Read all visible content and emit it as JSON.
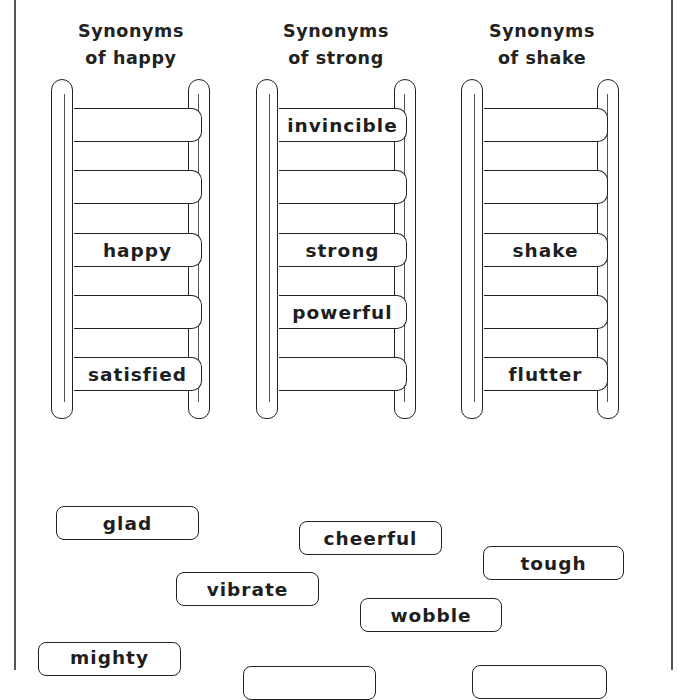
{
  "ladders": [
    {
      "heading_line1": "Synonyms",
      "heading_line2": "of happy",
      "rungs": [
        "",
        "",
        "happy",
        "",
        "satisfied"
      ]
    },
    {
      "heading_line1": "Synonyms",
      "heading_line2": "of strong",
      "rungs": [
        "invincible",
        "",
        "strong",
        "powerful",
        ""
      ]
    },
    {
      "heading_line1": "Synonyms",
      "heading_line2": "of shake",
      "rungs": [
        "",
        "",
        "shake",
        "",
        "flutter"
      ]
    }
  ],
  "word_cards": [
    {
      "word": "glad"
    },
    {
      "word": "cheerful"
    },
    {
      "word": "tough"
    },
    {
      "word": "vibrate"
    },
    {
      "word": "wobble"
    },
    {
      "word": "mighty"
    },
    {
      "word": ""
    },
    {
      "word": ""
    }
  ]
}
